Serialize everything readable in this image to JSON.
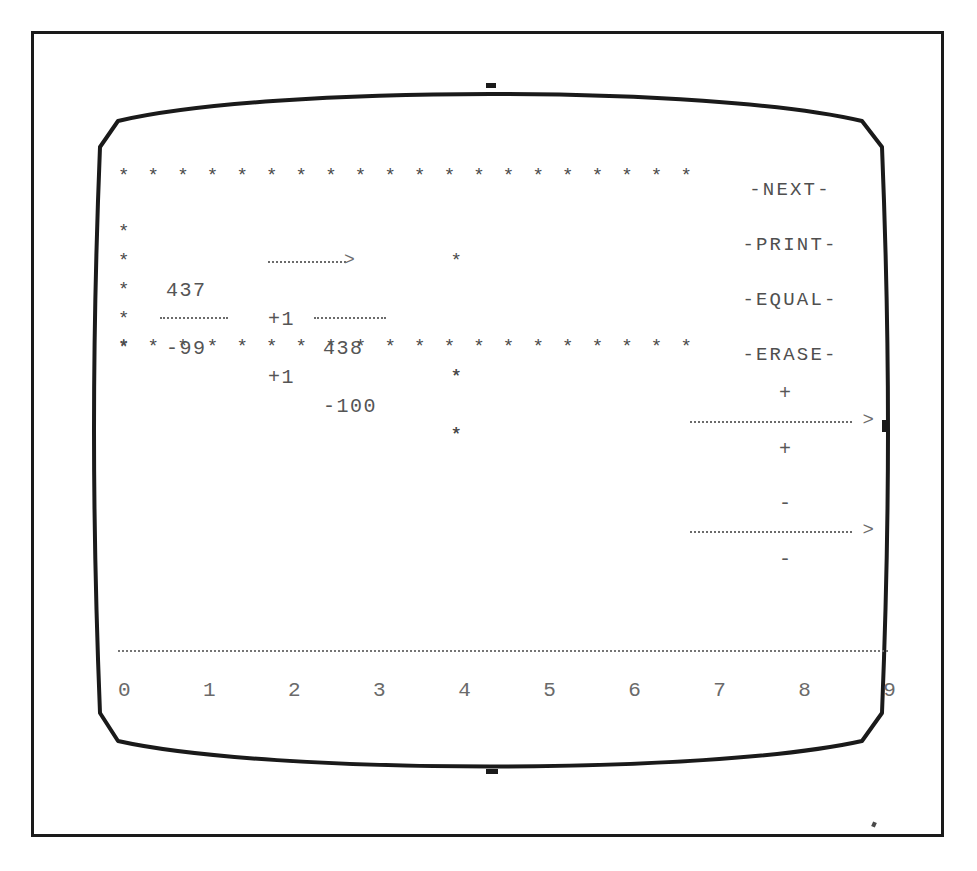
{
  "screen": {
    "device": "CRT monitor display",
    "calculation_box": {
      "border_char": "*",
      "border_width_chars": 20,
      "rows": [
        {
          "operand": "437",
          "operator": "+1",
          "result": "438"
        },
        {
          "operand": "-99",
          "operator": "+1",
          "result": "-100"
        }
      ],
      "arrow": "---->",
      "underline": "____"
    },
    "menu": {
      "items": [
        {
          "label": "-NEXT-",
          "name": "next"
        },
        {
          "label": "-PRINT-",
          "name": "print"
        },
        {
          "label": "-EQUAL-",
          "name": "equal"
        },
        {
          "label": "-ERASE-",
          "name": "erase"
        }
      ]
    },
    "operator_keys": [
      {
        "top_symbol": "+",
        "arrow": "----->",
        "bottom_symbol": "+",
        "name": "plus"
      },
      {
        "top_symbol": "-",
        "arrow": "----->",
        "bottom_symbol": "-",
        "name": "minus"
      }
    ],
    "ruler": {
      "digits": [
        "0",
        "1",
        "2",
        "3",
        "4",
        "5",
        "6",
        "7",
        "8",
        "9"
      ],
      "rule": "dotted"
    }
  },
  "colors": {
    "frame": "#1a1a1a",
    "screen_text": "#4a4a4a",
    "background": "#ffffff"
  }
}
